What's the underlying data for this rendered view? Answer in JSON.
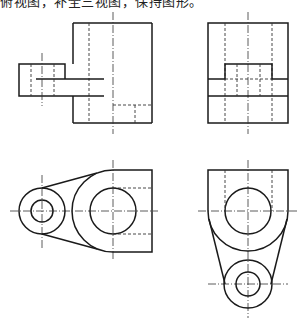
{
  "caption": "俯视图，补全三视图，保持图形。",
  "views": [
    {
      "name": "front-view",
      "label": "主视图"
    },
    {
      "name": "side-view",
      "label": "左视图"
    },
    {
      "name": "top-view",
      "label": "俯视图"
    },
    {
      "name": "bottom-right-view",
      "label": "视图"
    }
  ],
  "colors": {
    "line": "#1a1a1a",
    "background": "#ffffff"
  }
}
